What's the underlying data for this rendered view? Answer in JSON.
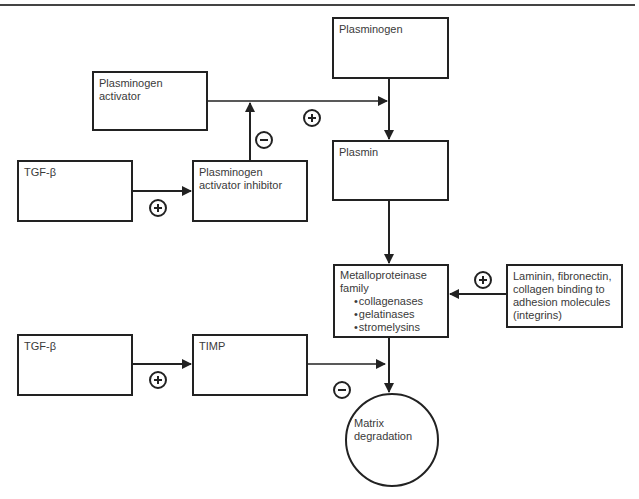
{
  "nodes": {
    "plasminogen": {
      "label": "Plasminogen"
    },
    "plasminogen_activator": {
      "label": "Plasminogen\nactivator"
    },
    "plasmin": {
      "label": "Plasmin"
    },
    "tgf_beta_1": {
      "label": "TGF-β"
    },
    "pai": {
      "label": "Plasminogen\nactivator inhibitor"
    },
    "metalloproteinase": {
      "label": "Metalloproteinase\nfamily",
      "items": [
        "collagenases",
        "gelatinases",
        "stromelysins"
      ]
    },
    "laminin": {
      "label": "Laminin, fibronectin,\ncollagen binding to\nadhesion molecules\n(integrins)"
    },
    "tgf_beta_2": {
      "label": "TGF-β"
    },
    "timp": {
      "label": "TIMP"
    },
    "matrix_degradation": {
      "label": "Matrix\ndegradation"
    }
  },
  "edges": [
    {
      "from": "Plasminogen activator",
      "to": "Plasminogen→Plasmin",
      "sign": "+"
    },
    {
      "from": "Plasminogen",
      "to": "Plasmin",
      "sign": ""
    },
    {
      "from": "TGF-β",
      "to": "Plasminogen activator inhibitor",
      "sign": "+"
    },
    {
      "from": "Plasminogen activator inhibitor",
      "to": "Plasminogen activator",
      "sign": "−"
    },
    {
      "from": "Plasmin",
      "to": "Metalloproteinase family",
      "sign": ""
    },
    {
      "from": "Laminin, fibronectin, collagen binding to adhesion molecules (integrins)",
      "to": "Metalloproteinase family",
      "sign": "+"
    },
    {
      "from": "TGF-β",
      "to": "TIMP",
      "sign": "+"
    },
    {
      "from": "TIMP",
      "to": "Metalloproteinase→Matrix degradation",
      "sign": "−"
    },
    {
      "from": "Metalloproteinase family",
      "to": "Matrix degradation",
      "sign": ""
    }
  ]
}
